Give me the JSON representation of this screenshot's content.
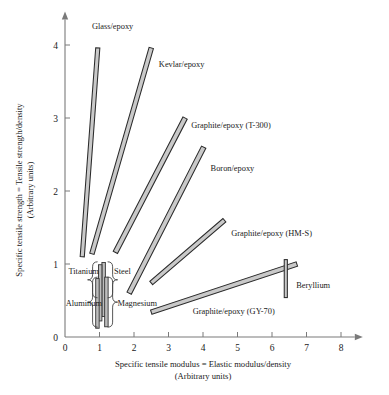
{
  "chart_data": {
    "type": "scatter",
    "title": "",
    "xlabel": "Specific tensile modulus = Elastic modulus/density",
    "xlabel_sub": "(Arbitrary units)",
    "ylabel": "Specific tensile strength = Tensile strength/density",
    "ylabel_sub": "(Arbitrary units)",
    "xlim": [
      0,
      8.4
    ],
    "ylim": [
      0,
      4.35
    ],
    "xticks": [
      "0",
      "1",
      "2",
      "3",
      "4",
      "5",
      "6",
      "7",
      "8"
    ],
    "xtick_values": [
      0,
      1,
      2,
      3,
      4,
      5,
      6,
      7,
      8
    ],
    "yticks": [
      "0",
      "1",
      "2",
      "3",
      "4"
    ],
    "ytick_values": [
      0,
      1,
      2,
      3,
      4
    ],
    "grid": false,
    "legend": "none",
    "band_fill": "#c9c9c9",
    "band_stroke": "#2b2b2b",
    "series": [
      {
        "name": "Glass/epoxy",
        "kind": "band",
        "x0": 0.5,
        "y0": 1.1,
        "x1": 0.95,
        "y1": 3.96,
        "width": 0.12,
        "label": "Glass/epoxy",
        "label_x": 0.78,
        "label_y": 4.22,
        "label_anchor": "start"
      },
      {
        "name": "Kevlar/epoxy",
        "kind": "band",
        "x0": 0.78,
        "y0": 1.14,
        "x1": 2.5,
        "y1": 3.96,
        "width": 0.13,
        "label": "Kevlar/epoxy",
        "label_x": 2.72,
        "label_y": 3.7,
        "label_anchor": "start"
      },
      {
        "name": "Graphite/epoxy (T-300)",
        "kind": "band",
        "x0": 1.46,
        "y0": 1.16,
        "x1": 3.48,
        "y1": 3.0,
        "width": 0.14,
        "label": "Graphite/epoxy (T-300)",
        "label_x": 3.66,
        "label_y": 2.86,
        "label_anchor": "start"
      },
      {
        "name": "Boron/epoxy",
        "kind": "band",
        "x0": 1.86,
        "y0": 0.6,
        "x1": 4.02,
        "y1": 2.6,
        "width": 0.14,
        "label": "Boron/epoxy",
        "label_x": 4.22,
        "label_y": 2.27,
        "label_anchor": "start"
      },
      {
        "name": "Graphite/epoxy (HM-S)",
        "kind": "band",
        "x0": 2.5,
        "y0": 0.74,
        "x1": 4.62,
        "y1": 1.6,
        "width": 0.13,
        "label": "Graphite/epoxy (HM-S)",
        "label_x": 4.82,
        "label_y": 1.39,
        "label_anchor": "start"
      },
      {
        "name": "Graphite/epoxy (GY-70)",
        "kind": "band",
        "x0": 2.5,
        "y0": 0.34,
        "x1": 6.72,
        "y1": 1.0,
        "width": 0.13,
        "label": "Graphite/epoxy (GY-70)",
        "label_x": 3.7,
        "label_y": 0.31,
        "label_anchor": "start"
      },
      {
        "name": "Beryllium",
        "kind": "vbar",
        "x0": 6.4,
        "y0": 0.54,
        "y1": 1.06,
        "width": 0.09,
        "label": "Beryllium",
        "label_x": 6.7,
        "label_y": 0.67,
        "label_anchor": "start"
      }
    ],
    "metals": [
      {
        "name": "Steel",
        "x": 1.12,
        "y0": 0.28,
        "y1": 1.02,
        "width": 0.1
      },
      {
        "name": "Titanium",
        "x": 1.02,
        "y0": 0.22,
        "y1": 0.99,
        "width": 0.1
      },
      {
        "name": "Magnesium",
        "x": 1.2,
        "y0": 0.14,
        "y1": 0.82,
        "width": 0.1
      },
      {
        "name": "Aluminum",
        "x": 0.94,
        "y0": 0.12,
        "y1": 0.8,
        "width": 0.1
      }
    ],
    "metal_labels": [
      {
        "text": "Titanium",
        "x": 0.1,
        "y": 0.86,
        "anchor": "start"
      },
      {
        "text": "Steel",
        "x": 1.42,
        "y": 0.86,
        "anchor": "start"
      },
      {
        "text": "Aluminum",
        "x": 0.02,
        "y": 0.43,
        "anchor": "start"
      },
      {
        "text": "Magnesium",
        "x": 1.52,
        "y": 0.43,
        "anchor": "start"
      }
    ]
  }
}
